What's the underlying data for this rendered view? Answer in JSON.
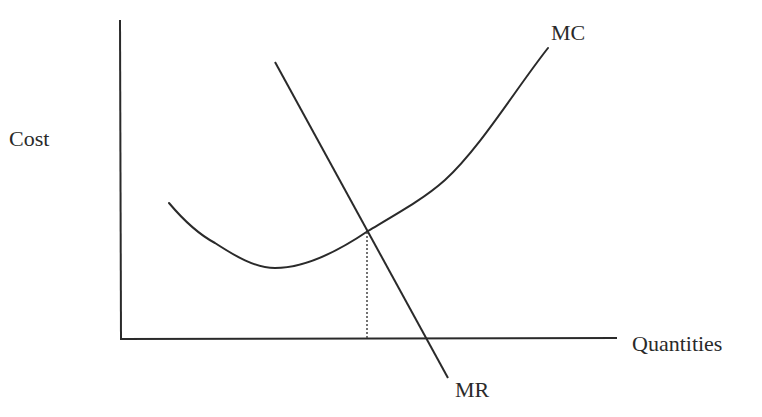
{
  "diagram": {
    "title": "",
    "y_axis_label": "Cost",
    "x_axis_label": "Quantities",
    "curves": [
      {
        "id": "mc",
        "label": "MC",
        "description": "Marginal cost curve, U-shaped, falls then rises steeply"
      },
      {
        "id": "mr",
        "label": "MR",
        "description": "Marginal revenue line, downward sloping"
      }
    ],
    "intersection": {
      "description": "MC = MR profit-maximizing point, dotted line dropped to quantity axis"
    },
    "colors": {
      "line": "#2a2a2a",
      "background": "#ffffff"
    }
  },
  "labels": {
    "cost": "Cost",
    "quantities": "Quantities",
    "mc": "MC",
    "mr": "MR"
  }
}
